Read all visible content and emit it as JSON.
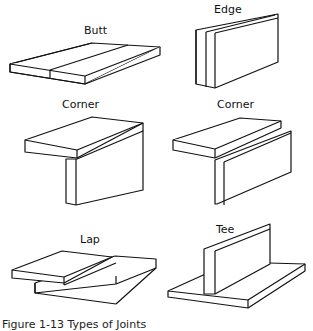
{
  "figure": {
    "joints": [
      {
        "label": "Butt"
      },
      {
        "label": "Edge"
      },
      {
        "label": "Corner"
      },
      {
        "label": "Corner"
      },
      {
        "label": "Lap"
      },
      {
        "label": "Tee"
      }
    ],
    "caption": "Figure 1-13  Types of Joints"
  }
}
